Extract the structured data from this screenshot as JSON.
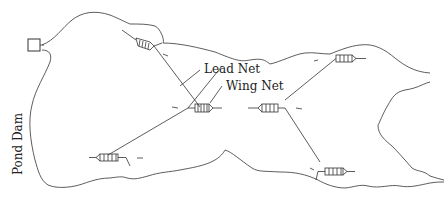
{
  "diagram": {
    "labels": {
      "lead_net": "Lead Net",
      "wing_net": "Wing Net",
      "pond_dam": "Pond Dam"
    },
    "nets": [
      {
        "id": "net-1",
        "position": "upper-left",
        "direction": "left-up"
      },
      {
        "id": "net-2",
        "position": "center",
        "direction": "right"
      },
      {
        "id": "net-3",
        "position": "lower-left",
        "direction": "left"
      },
      {
        "id": "net-4",
        "position": "upper-right",
        "direction": "right"
      },
      {
        "id": "net-5",
        "position": "center-right",
        "direction": "left"
      },
      {
        "id": "net-6",
        "position": "lower-right",
        "direction": "right"
      }
    ],
    "colors": {
      "line": "#333333",
      "background": "#ffffff"
    }
  }
}
